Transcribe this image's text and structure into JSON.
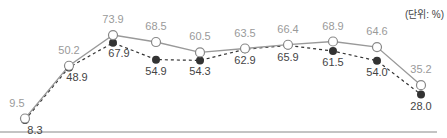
{
  "chart_data": {
    "type": "line",
    "title": "",
    "unit_label": "(단위: %)",
    "xlabel": "",
    "ylabel": "",
    "ylim": [
      0,
      100
    ],
    "grid": false,
    "legend": null,
    "categories": [
      "1",
      "2",
      "3",
      "4",
      "5",
      "6",
      "7",
      "8",
      "9",
      "10"
    ],
    "series": [
      {
        "name": "series-open",
        "style": "solid",
        "marker": "open-circle",
        "color": "#999999",
        "label_color": "#9a9a9a",
        "values": [
          9.5,
          50.2,
          73.9,
          68.5,
          60.5,
          63.5,
          66.4,
          68.9,
          64.6,
          35.2
        ]
      },
      {
        "name": "series-filled",
        "style": "dashed",
        "marker": "filled-circle",
        "color": "#333333",
        "label_color": "#444444",
        "values": [
          8.3,
          48.9,
          67.9,
          54.9,
          54.3,
          62.9,
          65.9,
          61.5,
          54.0,
          28.0
        ]
      }
    ]
  },
  "layout": {
    "x_positions": [
      25,
      69,
      113,
      156,
      200,
      245,
      288,
      333,
      377,
      421
    ],
    "y_base": 130.8,
    "y_scale": 1.296,
    "baseline_y": 132,
    "open_label_dy": [
      -12,
      -12,
      -12,
      -12,
      -12,
      -12,
      -12,
      -12,
      -12,
      -12
    ],
    "filled_label_dy": [
      14,
      14,
      14,
      15,
      15,
      15,
      -12,
      15,
      15,
      15
    ],
    "open_label_dx": [
      -8,
      0,
      0,
      0,
      0,
      0,
      0,
      0,
      0,
      0
    ],
    "filled_label_dx": [
      10,
      8,
      6,
      0,
      0,
      0,
      0,
      0,
      0,
      0
    ],
    "open_label_swap": [
      false,
      false,
      false,
      false,
      false,
      false,
      true,
      false,
      false,
      false
    ]
  }
}
